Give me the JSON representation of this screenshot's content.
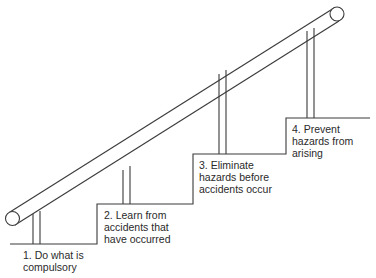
{
  "diagram": {
    "type": "staircase-with-handrail",
    "colors": {
      "line": "#3a3a3a",
      "text": "#2a2a2a",
      "background": "#ffffff"
    },
    "steps": [
      {
        "id": 1,
        "lines": [
          "1.  Do what  is",
          "compulsory"
        ]
      },
      {
        "id": 2,
        "lines": [
          "2. Learn from",
          "accidents that",
          "have occurred"
        ]
      },
      {
        "id": 3,
        "lines": [
          "3. Eliminate",
          "hazards before",
          "accidents occur"
        ]
      },
      {
        "id": 4,
        "lines": [
          "4. Prevent",
          "hazards from",
          "arising"
        ]
      }
    ]
  }
}
